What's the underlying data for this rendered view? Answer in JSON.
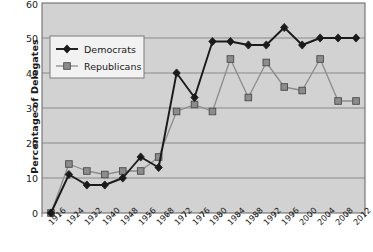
{
  "chart_data": {
    "type": "line",
    "title": "",
    "xlabel": "",
    "ylabel": "Percentage of Delegates",
    "ylim": [
      0,
      60
    ],
    "yticks": [
      0,
      10,
      20,
      30,
      40,
      50,
      60
    ],
    "grid": true,
    "legend_position": "upper-left-inside",
    "categories": [
      "1916",
      "1924",
      "1932",
      "1940",
      "1948",
      "1956",
      "1968",
      "1972",
      "1976",
      "1980",
      "1984",
      "1988",
      "1992",
      "1996",
      "2000",
      "2004",
      "2008",
      "2012"
    ],
    "series": [
      {
        "name": "Democrats",
        "color": "#1a1a1a",
        "marker": "diamond",
        "values": [
          0,
          11,
          8,
          8,
          10,
          16,
          13,
          40,
          33,
          49,
          49,
          48,
          48,
          53,
          48,
          50,
          50,
          50
        ]
      },
      {
        "name": "Republicans",
        "color": "#8c8c8c",
        "marker": "square",
        "values": [
          0,
          14,
          12,
          11,
          12,
          12,
          16,
          29,
          31,
          29,
          44,
          33,
          43,
          36,
          35,
          44,
          32,
          32
        ]
      }
    ]
  },
  "legend": {
    "items": [
      {
        "label": "Democrats",
        "color": "#1a1a1a",
        "marker": "diamond"
      },
      {
        "label": "Republicans",
        "color": "#8c8c8c",
        "marker": "square"
      }
    ]
  },
  "axis": {
    "y_title": "Percentage of Delegates",
    "y_tick_labels": [
      "60",
      "50",
      "40",
      "30",
      "20",
      "10",
      "0"
    ],
    "x_tick_labels": [
      "1916",
      "1924",
      "1932",
      "1940",
      "1948",
      "1956",
      "1968",
      "1972",
      "1976",
      "1980",
      "1984",
      "1988",
      "1992",
      "1996",
      "2000",
      "2004",
      "2008",
      "2012"
    ]
  },
  "colors": {
    "plot_background": "#d2d2d2",
    "gridline": "#8a8a8a",
    "plot_border": "#6e6e6e",
    "democrats": "#1a1a1a",
    "republicans": "#8c8c8c",
    "text": "#1a1a1a",
    "legend_background": "#f2f2f2"
  }
}
